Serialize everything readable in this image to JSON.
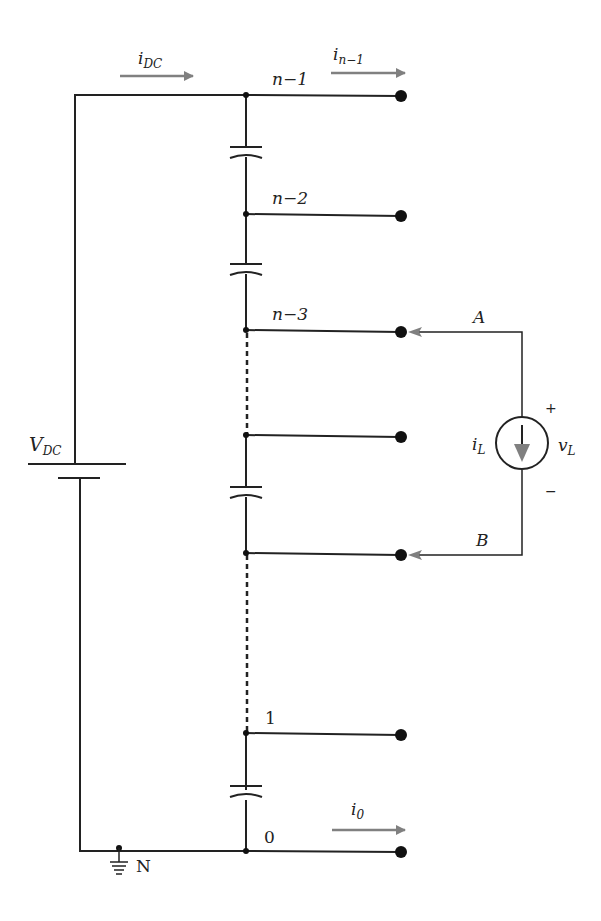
{
  "diagram": {
    "colors": {
      "wire": "#222222",
      "arrow": "#808080",
      "dot": "#111111",
      "background": "#ffffff"
    },
    "source": {
      "label": "V",
      "sub": "DC"
    },
    "currents": {
      "dc": {
        "label": "i",
        "sub": "DC"
      },
      "top": {
        "label": "i",
        "sub": "n−1"
      },
      "bottom": {
        "label": "i",
        "sub": "0"
      },
      "load": {
        "label": "i",
        "sub": "L"
      }
    },
    "load_voltage": {
      "label": "v",
      "sub": "L",
      "plus": "+",
      "minus": "−"
    },
    "nodes": [
      {
        "id": "n-1",
        "label": "n−1",
        "y": 95
      },
      {
        "id": "n-2",
        "label": "n−2",
        "y": 215
      },
      {
        "id": "n-3",
        "label": "n−3",
        "y": 331
      },
      {
        "id": "mid",
        "label": "",
        "y": 436
      },
      {
        "id": "lower",
        "label": "",
        "y": 553
      },
      {
        "id": "1",
        "label": "1",
        "y": 734
      },
      {
        "id": "0",
        "label": "0",
        "y": 851
      }
    ],
    "load_terminals": {
      "a": "A",
      "b": "B"
    },
    "ground": {
      "label": "N"
    }
  }
}
